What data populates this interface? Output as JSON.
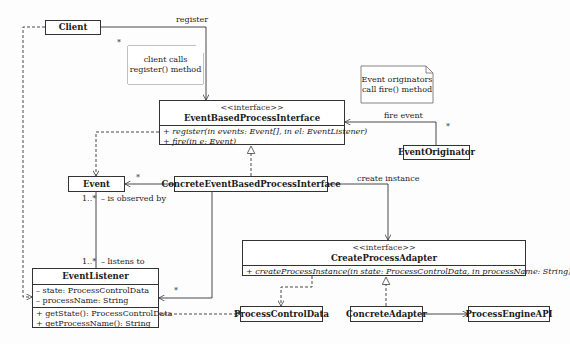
{
  "diagram": {
    "type": "UML class diagram",
    "classes": {
      "client": {
        "name": "Client"
      },
      "event_based_process_interface": {
        "stereotype": "<<interface>>",
        "name": "EventBasedProcessInterface",
        "methods": [
          "+ register(in events: Event[], in el: EventListener)",
          "+ fire(in e: Event)"
        ]
      },
      "event_originator": {
        "name": "EventOriginator"
      },
      "event": {
        "name": "Event"
      },
      "concrete_event_based_process_interface": {
        "name": "ConcreteEventBasedProcessInterface"
      },
      "create_process_adapter": {
        "stereotype": "<<interface>>",
        "name": "CreateProcessAdapter",
        "methods": [
          "+ createProcessInstance(in state: ProcessControlData, in processName: String)"
        ]
      },
      "event_listener": {
        "name": "EventListener",
        "attributes": [
          "– state: ProcessControlData",
          "– processName: String"
        ],
        "methods": [
          "+ getState(): ProcessControlData",
          "+ getProcessName(): String"
        ]
      },
      "process_control_data": {
        "name": "ProcessControlData"
      },
      "concrete_adapter": {
        "name": "ConcreteAdapter"
      },
      "process_engine_api": {
        "name": "ProcessEngineAPI"
      }
    },
    "notes": {
      "client_note": [
        "client calls",
        "register() method"
      ],
      "originator_note": [
        "Event originators",
        "call fire() method"
      ]
    },
    "labels": {
      "register": "register",
      "register_mult": "*",
      "fire_event": "fire event",
      "fire_mult": "*",
      "event_mult": "*",
      "create_instance": "create instance",
      "observed_mult": "1..*",
      "is_observed_by": "– is observed by",
      "listens_mult": "1..*",
      "listens_to": "– listens to",
      "listener_mult": "*"
    }
  }
}
